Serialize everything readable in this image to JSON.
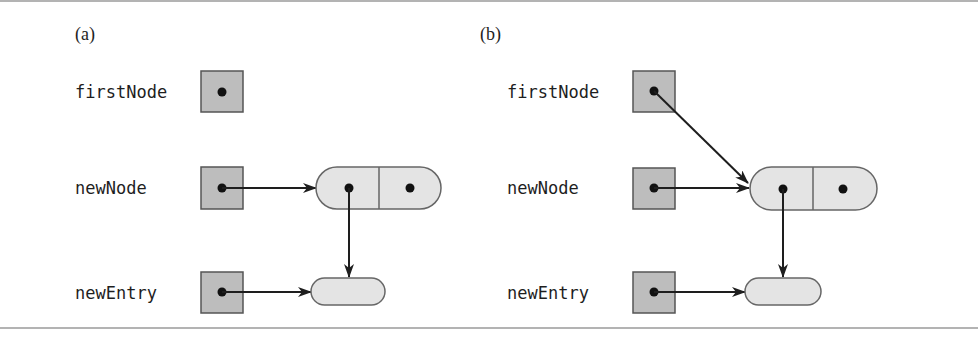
{
  "figure": {
    "panels": [
      {
        "id": "a",
        "label": "(a)",
        "variables": [
          {
            "name": "firstNode",
            "points_to": null
          },
          {
            "name": "newNode",
            "points_to": "node"
          },
          {
            "name": "newEntry",
            "points_to": "entry"
          }
        ],
        "node": {
          "fields": [
            "data",
            "next"
          ],
          "data_points_to": "entry"
        }
      },
      {
        "id": "b",
        "label": "(b)",
        "variables": [
          {
            "name": "firstNode",
            "points_to": "node"
          },
          {
            "name": "newNode",
            "points_to": "node"
          },
          {
            "name": "newEntry",
            "points_to": "entry"
          }
        ],
        "node": {
          "fields": [
            "data",
            "next"
          ],
          "data_points_to": "entry"
        }
      }
    ],
    "colors": {
      "box_fill": "#bdbdbd",
      "node_fill": "#e4e4e4",
      "stroke": "#555555",
      "arrow": "#1e1e1e",
      "rule": "#9a9a9a"
    }
  }
}
